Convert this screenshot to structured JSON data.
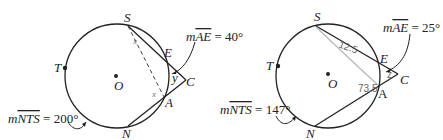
{
  "figures": [
    {
      "points": {
        "S": "S",
        "E": "E",
        "C": "C",
        "A": "A",
        "N": "N",
        "T": "T",
        "O": "O"
      },
      "arc_AE_label": "mAE = 40°",
      "arc_AE_prefix": "m",
      "arc_AE_name": "AE",
      "arc_AE_value": " = 40°",
      "arc_NTS_prefix": "m",
      "arc_NTS_name": "NTS",
      "arc_NTS_value": " = 200°",
      "angle_S_label": "x",
      "angle_A_label": "x",
      "angle_C_label": "y"
    },
    {
      "points": {
        "S": "S",
        "E": "E",
        "C": "C",
        "A": "A",
        "N": "N",
        "T": "T",
        "O": "O"
      },
      "arc_AE_prefix": "m",
      "arc_AE_name": "AE",
      "arc_AE_value": " = 25°",
      "arc_NTS_prefix": "m",
      "arc_NTS_name": "NTS",
      "arc_NTS_value": " = 147°",
      "angle_S_label": "12.5",
      "angle_A_label": "73.5",
      "angle_C_label": "z"
    }
  ]
}
